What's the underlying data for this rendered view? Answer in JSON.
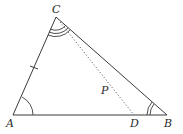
{
  "diagram": {
    "type": "triangle",
    "stroke_color": "#3a3a3a",
    "points": {
      "A": {
        "label": "A",
        "x": 13,
        "y": 115
      },
      "B": {
        "label": "B",
        "x": 167,
        "y": 115
      },
      "C": {
        "label": "C",
        "x": 56,
        "y": 17
      },
      "D": {
        "label": "D",
        "x": 134,
        "y": 115
      },
      "P": {
        "label": "P"
      }
    },
    "segments": [
      {
        "from": "A",
        "to": "B",
        "style": "solid"
      },
      {
        "from": "B",
        "to": "C",
        "style": "solid"
      },
      {
        "from": "C",
        "to": "A",
        "style": "solid"
      },
      {
        "from": "C",
        "to": "D",
        "style": "dotted"
      }
    ],
    "tick_marks": [
      {
        "segment": "AC",
        "count": 1
      }
    ],
    "angle_marks": [
      {
        "vertex": "A",
        "arcs": 1
      },
      {
        "vertex": "B",
        "arcs": 2
      },
      {
        "vertex": "C",
        "arcs": 3
      }
    ]
  }
}
